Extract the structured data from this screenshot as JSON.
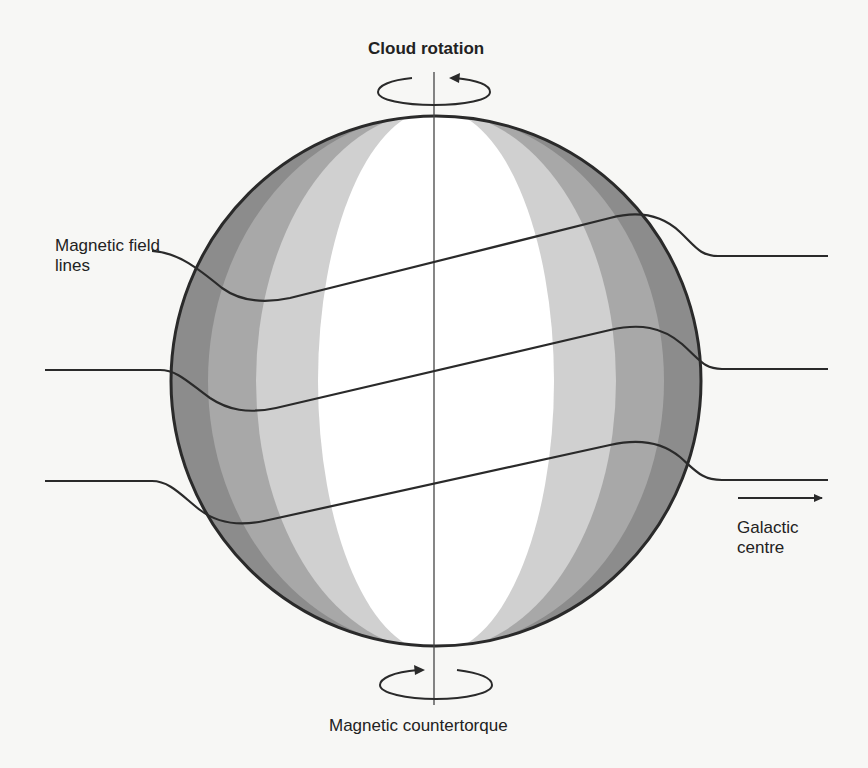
{
  "diagram": {
    "labels": {
      "top_rotation": "Cloud rotation",
      "field_lines": "Magnetic field lines",
      "direction": "Galactic centre",
      "bottom_torque": "Magnetic countertorque"
    },
    "elements": {
      "sphere": {
        "name": "molecular-cloud",
        "shading": "vertical bands, dark at limb to white at centre",
        "band_colors": [
          "#8a8a8a",
          "#a6a6a6",
          "#d2d2d2",
          "#ffffff"
        ],
        "outline_color": "#2a2a2a"
      },
      "rotation_axis": {
        "orientation": "vertical",
        "color": "#444444"
      },
      "field_lines_count": 3,
      "top_rotation_arrow": {
        "direction": "counterclockwise-viewed-from-front",
        "arrowhead": "right-end pointing left"
      },
      "bottom_rotation_arrow": {
        "direction": "opposite",
        "arrowhead": "left-end pointing right"
      },
      "galactic_arrow": {
        "direction": "right"
      }
    },
    "colors": {
      "background": "#f7f7f5",
      "line": "#2a2a2a",
      "text": "#222222"
    }
  }
}
